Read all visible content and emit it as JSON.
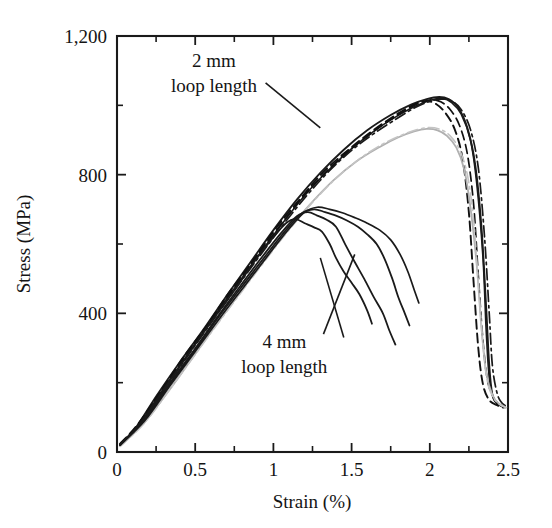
{
  "chart_data": {
    "type": "line",
    "title": "",
    "xlabel": "Strain (%)",
    "ylabel": "Stress (MPa)",
    "xlim": [
      0,
      2.5
    ],
    "ylim": [
      0,
      1200
    ],
    "grid": false,
    "legend": "none",
    "x_ticks": [
      0,
      0.5,
      1,
      1.5,
      2,
      2.5
    ],
    "x_tick_labels": [
      "0",
      "0.5",
      "1",
      "1.5",
      "2",
      "2.5"
    ],
    "x_minor_ticks": [
      0.25,
      0.75,
      1.25,
      1.75,
      2.25
    ],
    "y_ticks": [
      0,
      400,
      800,
      1200
    ],
    "y_tick_labels": [
      "0",
      "400",
      "800",
      "1,200"
    ],
    "y_minor_ticks": [
      200,
      600,
      1000
    ],
    "annotations": [
      {
        "name": "annotation-2mm",
        "text_line1": "2 mm",
        "text_line2": "loop length",
        "text_x": 0.62,
        "text_y": 1110,
        "leader": [
          [
            0.95,
            1065
          ],
          [
            1.3,
            935
          ]
        ]
      },
      {
        "name": "annotation-4mm",
        "text_line1": "4 mm",
        "text_line2": "loop length",
        "text_x": 1.07,
        "text_y": 300,
        "leader": [
          [
            1.32,
            340
          ],
          [
            1.52,
            570
          ]
        ]
      },
      {
        "name": "annotation-4mm-leader-2",
        "text_line1": "",
        "text_line2": "",
        "leader": [
          [
            1.45,
            330
          ],
          [
            1.3,
            560
          ]
        ]
      }
    ],
    "series": [
      {
        "name": "2mm-solid-1",
        "group": "2 mm loop length",
        "style": "solid",
        "color": "#1a1a1a",
        "width": 1.9,
        "points": [
          [
            0.02,
            22
          ],
          [
            0.12,
            70
          ],
          [
            0.25,
            160
          ],
          [
            0.4,
            258
          ],
          [
            0.55,
            352
          ],
          [
            0.7,
            450
          ],
          [
            0.85,
            545
          ],
          [
            1.0,
            640
          ],
          [
            1.15,
            728
          ],
          [
            1.3,
            805
          ],
          [
            1.45,
            872
          ],
          [
            1.6,
            928
          ],
          [
            1.75,
            972
          ],
          [
            1.88,
            1002
          ],
          [
            1.98,
            1018
          ],
          [
            2.06,
            1024
          ],
          [
            2.12,
            1018
          ],
          [
            2.18,
            995
          ],
          [
            2.24,
            935
          ],
          [
            2.29,
            830
          ],
          [
            2.33,
            650
          ],
          [
            2.36,
            420
          ],
          [
            2.38,
            250
          ],
          [
            2.4,
            165
          ],
          [
            2.43,
            140
          ],
          [
            2.47,
            132
          ]
        ]
      },
      {
        "name": "2mm-solid-2",
        "group": "2 mm loop length",
        "style": "solid",
        "color": "#1a1a1a",
        "width": 1.6,
        "points": [
          [
            0.02,
            20
          ],
          [
            0.15,
            85
          ],
          [
            0.3,
            185
          ],
          [
            0.45,
            280
          ],
          [
            0.6,
            378
          ],
          [
            0.75,
            472
          ],
          [
            0.9,
            565
          ],
          [
            1.05,
            655
          ],
          [
            1.2,
            740
          ],
          [
            1.35,
            812
          ],
          [
            1.5,
            875
          ],
          [
            1.65,
            928
          ],
          [
            1.78,
            966
          ],
          [
            1.9,
            996
          ],
          [
            2.0,
            1014
          ],
          [
            2.08,
            1020
          ],
          [
            2.14,
            1008
          ],
          [
            2.2,
            975
          ],
          [
            2.26,
            900
          ],
          [
            2.3,
            775
          ],
          [
            2.34,
            560
          ],
          [
            2.36,
            355
          ],
          [
            2.38,
            215
          ],
          [
            2.41,
            152
          ],
          [
            2.45,
            134
          ],
          [
            2.48,
            128
          ]
        ]
      },
      {
        "name": "2mm-dashed-1",
        "group": "2 mm loop length",
        "style": "dashed",
        "color": "#111111",
        "width": 1.9,
        "points": [
          [
            0.02,
            24
          ],
          [
            0.13,
            78
          ],
          [
            0.28,
            175
          ],
          [
            0.42,
            270
          ],
          [
            0.58,
            368
          ],
          [
            0.72,
            462
          ],
          [
            0.88,
            558
          ],
          [
            1.02,
            648
          ],
          [
            1.18,
            735
          ],
          [
            1.32,
            808
          ],
          [
            1.48,
            872
          ],
          [
            1.62,
            922
          ],
          [
            1.74,
            960
          ],
          [
            1.84,
            988
          ],
          [
            1.92,
            1006
          ],
          [
            1.98,
            1012
          ],
          [
            2.04,
            1004
          ],
          [
            2.1,
            978
          ],
          [
            2.16,
            930
          ],
          [
            2.21,
            845
          ],
          [
            2.25,
            690
          ],
          [
            2.28,
            490
          ],
          [
            2.31,
            300
          ],
          [
            2.34,
            195
          ],
          [
            2.38,
            150
          ],
          [
            2.43,
            135
          ],
          [
            2.47,
            128
          ]
        ]
      },
      {
        "name": "2mm-dashed-2",
        "group": "2 mm loop length",
        "style": "dashed",
        "color": "#111111",
        "width": 1.7,
        "points": [
          [
            0.02,
            20
          ],
          [
            0.14,
            82
          ],
          [
            0.29,
            180
          ],
          [
            0.44,
            275
          ],
          [
            0.59,
            372
          ],
          [
            0.74,
            468
          ],
          [
            0.89,
            562
          ],
          [
            1.04,
            652
          ],
          [
            1.19,
            736
          ],
          [
            1.34,
            810
          ],
          [
            1.49,
            872
          ],
          [
            1.64,
            924
          ],
          [
            1.76,
            962
          ],
          [
            1.86,
            990
          ],
          [
            1.94,
            1008
          ],
          [
            2.01,
            1016
          ],
          [
            2.07,
            1010
          ],
          [
            2.13,
            988
          ],
          [
            2.19,
            942
          ],
          [
            2.24,
            860
          ],
          [
            2.28,
            715
          ],
          [
            2.31,
            510
          ],
          [
            2.34,
            320
          ],
          [
            2.37,
            205
          ],
          [
            2.41,
            155
          ],
          [
            2.45,
            136
          ],
          [
            2.48,
            130
          ]
        ]
      },
      {
        "name": "2mm-dashdot-1",
        "group": "2 mm loop length",
        "style": "dashdot",
        "color": "#1a1a1a",
        "width": 1.7,
        "points": [
          [
            0.02,
            18
          ],
          [
            0.16,
            88
          ],
          [
            0.31,
            186
          ],
          [
            0.46,
            282
          ],
          [
            0.61,
            378
          ],
          [
            0.76,
            472
          ],
          [
            0.91,
            564
          ],
          [
            1.06,
            654
          ],
          [
            1.21,
            738
          ],
          [
            1.36,
            812
          ],
          [
            1.51,
            874
          ],
          [
            1.66,
            924
          ],
          [
            1.79,
            962
          ],
          [
            1.9,
            992
          ],
          [
            1.99,
            1010
          ],
          [
            2.07,
            1018
          ],
          [
            2.14,
            1012
          ],
          [
            2.2,
            988
          ],
          [
            2.26,
            930
          ],
          [
            2.31,
            820
          ],
          [
            2.35,
            620
          ],
          [
            2.38,
            400
          ],
          [
            2.4,
            250
          ],
          [
            2.43,
            170
          ],
          [
            2.46,
            142
          ],
          [
            2.49,
            132
          ]
        ]
      },
      {
        "name": "2mm-gray-1",
        "group": "2 mm loop length",
        "style": "solid",
        "color": "#b0b0b0",
        "width": 1.8,
        "points": [
          [
            0.02,
            18
          ],
          [
            0.17,
            82
          ],
          [
            0.33,
            176
          ],
          [
            0.48,
            270
          ],
          [
            0.63,
            364
          ],
          [
            0.78,
            455
          ],
          [
            0.93,
            545
          ],
          [
            1.08,
            632
          ],
          [
            1.23,
            712
          ],
          [
            1.38,
            782
          ],
          [
            1.53,
            838
          ],
          [
            1.68,
            880
          ],
          [
            1.8,
            908
          ],
          [
            1.9,
            925
          ],
          [
            1.98,
            932
          ],
          [
            2.05,
            928
          ],
          [
            2.11,
            912
          ],
          [
            2.17,
            878
          ],
          [
            2.22,
            815
          ],
          [
            2.26,
            705
          ],
          [
            2.3,
            540
          ],
          [
            2.33,
            360
          ],
          [
            2.36,
            230
          ],
          [
            2.4,
            165
          ],
          [
            2.44,
            140
          ],
          [
            2.48,
            130
          ]
        ]
      },
      {
        "name": "2mm-gray-dashed",
        "group": "2 mm loop length",
        "style": "dashdot",
        "color": "#c4c4c4",
        "width": 1.6,
        "points": [
          [
            0.02,
            16
          ],
          [
            0.18,
            86
          ],
          [
            0.34,
            182
          ],
          [
            0.49,
            275
          ],
          [
            0.64,
            368
          ],
          [
            0.79,
            458
          ],
          [
            0.94,
            548
          ],
          [
            1.09,
            635
          ],
          [
            1.24,
            715
          ],
          [
            1.39,
            785
          ],
          [
            1.54,
            842
          ],
          [
            1.69,
            886
          ],
          [
            1.82,
            914
          ],
          [
            1.92,
            930
          ],
          [
            2.0,
            936
          ],
          [
            2.07,
            930
          ],
          [
            2.13,
            912
          ],
          [
            2.19,
            872
          ],
          [
            2.24,
            800
          ],
          [
            2.28,
            670
          ],
          [
            2.31,
            490
          ],
          [
            2.34,
            310
          ],
          [
            2.37,
            200
          ],
          [
            2.41,
            155
          ],
          [
            2.45,
            136
          ],
          [
            2.49,
            128
          ]
        ]
      },
      {
        "name": "4mm-solid-1",
        "group": "4 mm loop length",
        "style": "solid",
        "color": "#1a1a1a",
        "width": 1.8,
        "points": [
          [
            0.02,
            20
          ],
          [
            0.15,
            84
          ],
          [
            0.3,
            182
          ],
          [
            0.45,
            278
          ],
          [
            0.6,
            374
          ],
          [
            0.75,
            466
          ],
          [
            0.88,
            550
          ],
          [
            1.0,
            620
          ],
          [
            1.08,
            660
          ],
          [
            1.14,
            672
          ],
          [
            1.2,
            660
          ],
          [
            1.26,
            648
          ],
          [
            1.31,
            636
          ],
          [
            1.36,
            600
          ],
          [
            1.4,
            560
          ],
          [
            1.45,
            520
          ],
          [
            1.5,
            488
          ],
          [
            1.55,
            455
          ],
          [
            1.6,
            408
          ],
          [
            1.63,
            370
          ]
        ]
      },
      {
        "name": "4mm-solid-2",
        "group": "4 mm loop length",
        "style": "solid",
        "color": "#1a1a1a",
        "width": 1.8,
        "points": [
          [
            0.02,
            20
          ],
          [
            0.16,
            88
          ],
          [
            0.32,
            188
          ],
          [
            0.48,
            286
          ],
          [
            0.63,
            382
          ],
          [
            0.78,
            474
          ],
          [
            0.92,
            558
          ],
          [
            1.05,
            632
          ],
          [
            1.15,
            680
          ],
          [
            1.22,
            692
          ],
          [
            1.28,
            682
          ],
          [
            1.34,
            670
          ],
          [
            1.4,
            650
          ],
          [
            1.46,
            598
          ],
          [
            1.52,
            548
          ],
          [
            1.58,
            500
          ],
          [
            1.64,
            448
          ],
          [
            1.7,
            400
          ],
          [
            1.74,
            352
          ],
          [
            1.78,
            310
          ]
        ]
      },
      {
        "name": "4mm-solid-3",
        "group": "4 mm loop length",
        "style": "solid",
        "color": "#1a1a1a",
        "width": 1.8,
        "points": [
          [
            0.02,
            22
          ],
          [
            0.17,
            90
          ],
          [
            0.33,
            190
          ],
          [
            0.49,
            288
          ],
          [
            0.64,
            384
          ],
          [
            0.8,
            478
          ],
          [
            0.95,
            566
          ],
          [
            1.08,
            640
          ],
          [
            1.18,
            688
          ],
          [
            1.26,
            700
          ],
          [
            1.33,
            692
          ],
          [
            1.4,
            682
          ],
          [
            1.47,
            668
          ],
          [
            1.54,
            650
          ],
          [
            1.6,
            628
          ],
          [
            1.66,
            600
          ],
          [
            1.71,
            558
          ],
          [
            1.76,
            500
          ],
          [
            1.8,
            445
          ],
          [
            1.84,
            400
          ],
          [
            1.87,
            365
          ]
        ]
      },
      {
        "name": "4mm-solid-4",
        "group": "4 mm loop length",
        "style": "solid",
        "color": "#1a1a1a",
        "width": 1.7,
        "points": [
          [
            0.02,
            20
          ],
          [
            0.18,
            92
          ],
          [
            0.34,
            192
          ],
          [
            0.5,
            290
          ],
          [
            0.66,
            388
          ],
          [
            0.82,
            482
          ],
          [
            0.97,
            570
          ],
          [
            1.1,
            644
          ],
          [
            1.2,
            692
          ],
          [
            1.28,
            706
          ],
          [
            1.36,
            700
          ],
          [
            1.44,
            690
          ],
          [
            1.52,
            676
          ],
          [
            1.6,
            660
          ],
          [
            1.68,
            640
          ],
          [
            1.75,
            612
          ],
          [
            1.81,
            570
          ],
          [
            1.86,
            520
          ],
          [
            1.9,
            468
          ],
          [
            1.93,
            430
          ]
        ]
      }
    ]
  },
  "axes": {
    "x_axis_name": "strain-axis",
    "y_axis_name": "stress-axis"
  }
}
